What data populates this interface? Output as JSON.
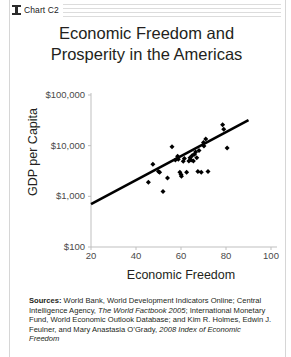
{
  "header": {
    "icon": "chart-spool-icon",
    "label": "Chart C2"
  },
  "title": {
    "line1": "Economic Freedom and",
    "line2": "Prosperity in the Americas"
  },
  "sources": {
    "prefix": "Sources:",
    "text_1": " World Bank, World Development Indicators Online; Central Intelligence Agency, ",
    "italic_1": "The World Factbook 2005",
    "text_2": "; International Monetary Fund, World Economic Outlook Database; and Kim R. Holmes, Edwin J. Feulner, and Mary Anastasia O’Grady, ",
    "italic_2": "2008 Index of Economic Freedom"
  },
  "chart_data": {
    "type": "scatter",
    "title": "Economic Freedom and Prosperity in the Americas",
    "xlabel": "Economic Freedom",
    "ylabel": "GDP per Capita",
    "xlim": [
      20,
      100
    ],
    "ylim": [
      100,
      100000
    ],
    "yscale": "log",
    "xscale": "linear",
    "grid": false,
    "legend": false,
    "xticks": [
      "20",
      "40",
      "60",
      "80",
      "100"
    ],
    "xtick_values": [
      20,
      40,
      60,
      80,
      100
    ],
    "yticks": [
      "$100",
      "$1,000",
      "$10,000",
      "$100,000"
    ],
    "ytick_values": [
      100,
      1000,
      10000,
      100000
    ],
    "marker": "diamond",
    "marker_color": "#000000",
    "points": [
      {
        "x": 45.5,
        "y": 1900
      },
      {
        "x": 47.5,
        "y": 4300
      },
      {
        "x": 50.0,
        "y": 3100
      },
      {
        "x": 50.5,
        "y": 3000
      },
      {
        "x": 52.0,
        "y": 1250
      },
      {
        "x": 54.0,
        "y": 2300
      },
      {
        "x": 56.0,
        "y": 9500
      },
      {
        "x": 57.5,
        "y": 5200
      },
      {
        "x": 58.5,
        "y": 6200
      },
      {
        "x": 58.8,
        "y": 5400
      },
      {
        "x": 59.5,
        "y": 3000
      },
      {
        "x": 60.0,
        "y": 2700
      },
      {
        "x": 60.2,
        "y": 2500
      },
      {
        "x": 61.0,
        "y": 4900
      },
      {
        "x": 61.5,
        "y": 5600
      },
      {
        "x": 62.5,
        "y": 3000
      },
      {
        "x": 63.5,
        "y": 5000
      },
      {
        "x": 64.0,
        "y": 5800
      },
      {
        "x": 64.5,
        "y": 5200
      },
      {
        "x": 65.0,
        "y": 6400
      },
      {
        "x": 65.5,
        "y": 5000
      },
      {
        "x": 66.0,
        "y": 6800
      },
      {
        "x": 66.5,
        "y": 7500
      },
      {
        "x": 67.0,
        "y": 5800
      },
      {
        "x": 67.5,
        "y": 3100
      },
      {
        "x": 68.0,
        "y": 8000
      },
      {
        "x": 69.0,
        "y": 3000
      },
      {
        "x": 70.0,
        "y": 11500
      },
      {
        "x": 70.2,
        "y": 9800
      },
      {
        "x": 71.0,
        "y": 13500
      },
      {
        "x": 72.0,
        "y": 3100
      },
      {
        "x": 78.5,
        "y": 26000
      },
      {
        "x": 79.0,
        "y": 21000
      },
      {
        "x": 80.5,
        "y": 9000
      }
    ],
    "trendline": {
      "x_start": 20,
      "y_start": 700,
      "x_end": 90,
      "y_end": 32000,
      "color": "#000000"
    }
  }
}
